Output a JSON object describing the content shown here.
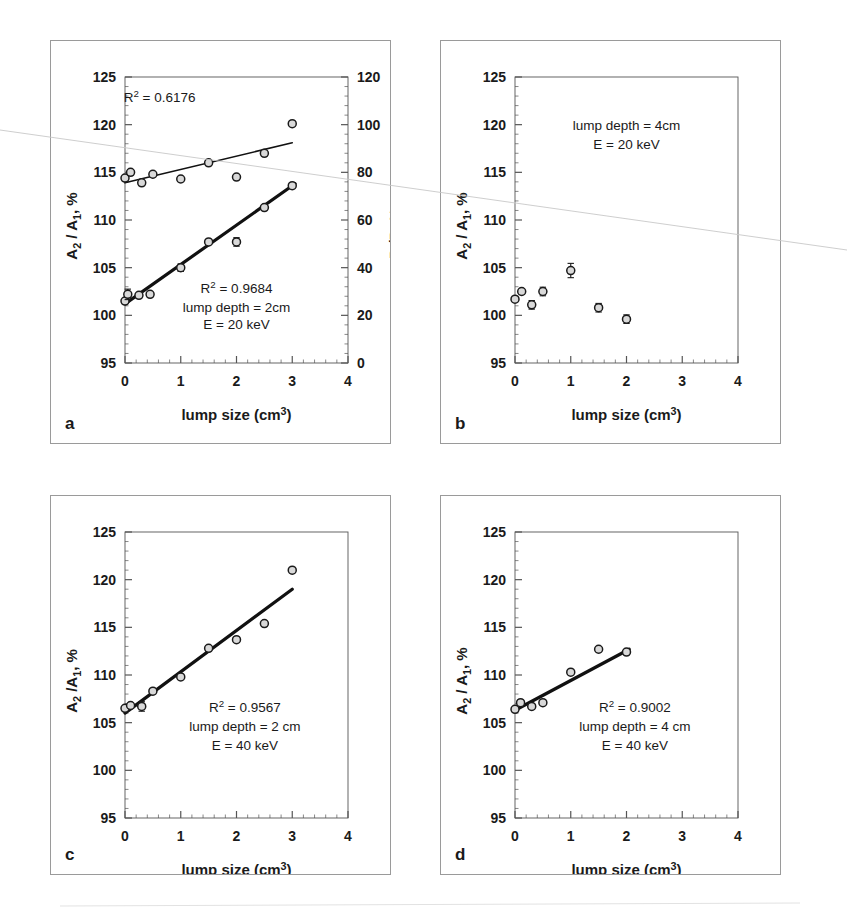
{
  "figure": {
    "background_color": "#ffffff",
    "ink_color": "#1a1a1a",
    "panel_border_color": "#9a9a9a",
    "axis_color": "#555555",
    "marker_edge_color": "#1a1a1a",
    "marker_fill_color": "#d9d9d9",
    "fit_line_color": "#111111"
  },
  "axes_common": {
    "xlabel": "lump size (cm³)",
    "xlabel_parts": {
      "text": "lump size (cm",
      "superscript": "3",
      "close": ")"
    },
    "ylabel_left": "A₂ / A₁, %",
    "ylabel_left_parts": {
      "a": "A",
      "sub2": "2",
      "slash": " / A",
      "sub1": "1",
      "tail": ", %"
    },
    "x_ticks": [
      "0",
      "1",
      "2",
      "3",
      "4"
    ],
    "x_tick_values": [
      0,
      1,
      2,
      3,
      4
    ],
    "y_ticks": [
      "95",
      "100",
      "105",
      "110",
      "115",
      "120",
      "125"
    ],
    "y_tick_values": [
      95,
      100,
      105,
      110,
      115,
      120,
      125
    ],
    "xlim": [
      0,
      4
    ],
    "ylim": [
      95,
      125
    ],
    "minor_ticks_per_interval": 5
  },
  "chart_data": [
    {
      "id": "a",
      "panel_letter": "a",
      "type": "scatter",
      "title": "",
      "xlabel": "lump size (cm³)",
      "ylabel": "A₂ / A₁, %",
      "ylabel_right": "P₂/P₁,%",
      "ylabel_right_parts": {
        "p": "P",
        "sub2": "2",
        "slash": "/P",
        "sub1": "1",
        "tail": ",%"
      },
      "xlim": [
        0,
        4
      ],
      "ylim": [
        95,
        125
      ],
      "ylim_right": [
        0,
        120
      ],
      "y_ticks_right": [
        "0",
        "20",
        "40",
        "60",
        "80",
        "100",
        "120"
      ],
      "y_tick_values_right": [
        0,
        20,
        40,
        60,
        80,
        100,
        120
      ],
      "grid": false,
      "legend": "none",
      "annotations": [
        {
          "name": "r2-upper",
          "text": "R² = 0.6176",
          "text_parts": {
            "base": "R",
            "sup": "2",
            "tail": " = 0.6176"
          },
          "x": 0.62,
          "y": 122.4
        },
        {
          "name": "r2-lower",
          "text": "R² = 0.9684",
          "text_parts": {
            "base": "R",
            "sup": "2",
            "tail": " = 0.9684"
          },
          "x": 2.0,
          "y": 102.3
        },
        {
          "name": "lump-depth",
          "text": "lump depth = 2cm",
          "x": 2.0,
          "y": 100.4
        },
        {
          "name": "energy",
          "text": "E = 20 keV",
          "x": 2.0,
          "y": 98.6
        }
      ],
      "series": [
        {
          "name": "P2/P1 (right axis)",
          "axis": "right",
          "marker": "open-circle",
          "points": [
            {
              "x": 0.0,
              "y": 114.4,
              "err": 0.0
            },
            {
              "x": 0.1,
              "y": 115.0,
              "err": 0.0
            },
            {
              "x": 0.3,
              "y": 113.9,
              "err": 0.0
            },
            {
              "x": 0.5,
              "y": 114.8,
              "err": 0.0
            },
            {
              "x": 1.0,
              "y": 114.3,
              "err": 0.0
            },
            {
              "x": 1.5,
              "y": 116.0,
              "err": 0.0
            },
            {
              "x": 2.0,
              "y": 114.5,
              "err": 0.0
            },
            {
              "x": 2.5,
              "y": 117.0,
              "err": 0.0
            },
            {
              "x": 3.0,
              "y": 120.1,
              "err": 0.0
            }
          ],
          "fit_line": {
            "x0": 0.0,
            "y0": 113.9,
            "x1": 3.0,
            "y1": 118.1,
            "width": 1.6
          }
        },
        {
          "name": "A2/A1 (left axis)",
          "axis": "left",
          "marker": "open-circle",
          "points": [
            {
              "x": 0.0,
              "y": 101.5,
              "err": 0.0
            },
            {
              "x": 0.05,
              "y": 102.2,
              "err": 0.55
            },
            {
              "x": 0.25,
              "y": 102.1,
              "err": 0.0
            },
            {
              "x": 0.45,
              "y": 102.2,
              "err": 0.0
            },
            {
              "x": 1.0,
              "y": 105.0,
              "err": 0.4
            },
            {
              "x": 1.5,
              "y": 107.7,
              "err": 0.0
            },
            {
              "x": 2.0,
              "y": 107.7,
              "err": 0.45
            },
            {
              "x": 2.5,
              "y": 111.3,
              "err": 0.0
            },
            {
              "x": 3.0,
              "y": 113.6,
              "err": 0.0
            }
          ],
          "fit_line": {
            "x0": 0.0,
            "y0": 101.2,
            "x1": 3.05,
            "y1": 113.8,
            "width": 3.2
          }
        }
      ]
    },
    {
      "id": "b",
      "panel_letter": "b",
      "type": "scatter",
      "title": "",
      "xlabel": "lump size (cm³)",
      "ylabel": "A₂ / A₁, %",
      "xlim": [
        0,
        4
      ],
      "ylim": [
        95,
        125
      ],
      "grid": false,
      "legend": "none",
      "annotations": [
        {
          "name": "lump-depth",
          "text": "lump depth = 4cm",
          "x": 2.0,
          "y": 119.4
        },
        {
          "name": "energy",
          "text": "E = 20 keV",
          "x": 2.0,
          "y": 117.4
        }
      ],
      "series": [
        {
          "name": "A2/A1",
          "axis": "left",
          "marker": "open-circle",
          "points": [
            {
              "x": 0.0,
              "y": 101.7,
              "err": 0.0
            },
            {
              "x": 0.12,
              "y": 102.5,
              "err": 0.0
            },
            {
              "x": 0.3,
              "y": 101.1,
              "err": 0.45
            },
            {
              "x": 0.5,
              "y": 102.5,
              "err": 0.45
            },
            {
              "x": 1.0,
              "y": 104.7,
              "err": 0.75
            },
            {
              "x": 1.5,
              "y": 100.8,
              "err": 0.45
            },
            {
              "x": 2.0,
              "y": 99.6,
              "err": 0.45
            }
          ],
          "fit_line": null
        }
      ]
    },
    {
      "id": "c",
      "panel_letter": "c",
      "type": "scatter",
      "title": "",
      "xlabel": "lump size (cm³)",
      "ylabel": "A₂ /A₁, %",
      "xlim": [
        0,
        4
      ],
      "ylim": [
        95,
        125
      ],
      "grid": false,
      "legend": "none",
      "annotations": [
        {
          "name": "r2",
          "text": "R² = 0.9567",
          "text_parts": {
            "base": "R",
            "sup": "2",
            "tail": " = 0.9567"
          },
          "x": 2.15,
          "y": 106.1
        },
        {
          "name": "lump-depth",
          "text": "lump depth = 2 cm",
          "x": 2.15,
          "y": 104.1
        },
        {
          "name": "energy",
          "text": "E = 40 keV",
          "x": 2.15,
          "y": 102.1
        }
      ],
      "series": [
        {
          "name": "A2/A1",
          "axis": "left",
          "marker": "open-circle",
          "points": [
            {
              "x": 0.0,
              "y": 106.5,
              "err": 0.0
            },
            {
              "x": 0.1,
              "y": 106.8,
              "err": 0.0
            },
            {
              "x": 0.3,
              "y": 106.7,
              "err": 0.5
            },
            {
              "x": 0.5,
              "y": 108.3,
              "err": 0.0
            },
            {
              "x": 1.0,
              "y": 109.8,
              "err": 0.0
            },
            {
              "x": 1.5,
              "y": 112.8,
              "err": 0.0
            },
            {
              "x": 2.0,
              "y": 113.7,
              "err": 0.0
            },
            {
              "x": 2.5,
              "y": 115.4,
              "err": 0.0
            },
            {
              "x": 3.0,
              "y": 121.0,
              "err": 0.0
            }
          ],
          "fit_line": {
            "x0": 0.0,
            "y0": 106.0,
            "x1": 3.0,
            "y1": 119.0,
            "width": 3.2
          }
        }
      ]
    },
    {
      "id": "d",
      "panel_letter": "d",
      "type": "scatter",
      "title": "",
      "xlabel": "lump size (cm³)",
      "ylabel": "A₂ / A₁, %",
      "xlim": [
        0,
        4
      ],
      "ylim": [
        95,
        125
      ],
      "grid": false,
      "legend": "none",
      "annotations": [
        {
          "name": "r2",
          "text": "R² = 0.9002",
          "text_parts": {
            "base": "R",
            "sup": "2",
            "tail": " = 0.9002"
          },
          "x": 2.15,
          "y": 106.1
        },
        {
          "name": "lump-depth",
          "text": "lump depth = 4 cm",
          "x": 2.15,
          "y": 104.1
        },
        {
          "name": "energy",
          "text": "E = 40 keV",
          "x": 2.15,
          "y": 102.1
        }
      ],
      "series": [
        {
          "name": "A2/A1",
          "axis": "left",
          "marker": "open-circle",
          "points": [
            {
              "x": 0.0,
              "y": 106.4,
              "err": 0.0
            },
            {
              "x": 0.1,
              "y": 107.1,
              "err": 0.0
            },
            {
              "x": 0.3,
              "y": 106.7,
              "err": 0.0
            },
            {
              "x": 0.5,
              "y": 107.1,
              "err": 0.0
            },
            {
              "x": 1.0,
              "y": 110.3,
              "err": 0.0
            },
            {
              "x": 1.5,
              "y": 112.7,
              "err": 0.0
            },
            {
              "x": 2.0,
              "y": 112.4,
              "err": 0.0
            }
          ],
          "fit_line": {
            "x0": 0.0,
            "y0": 106.3,
            "x1": 2.05,
            "y1": 112.7,
            "width": 3.2
          }
        }
      ]
    }
  ]
}
